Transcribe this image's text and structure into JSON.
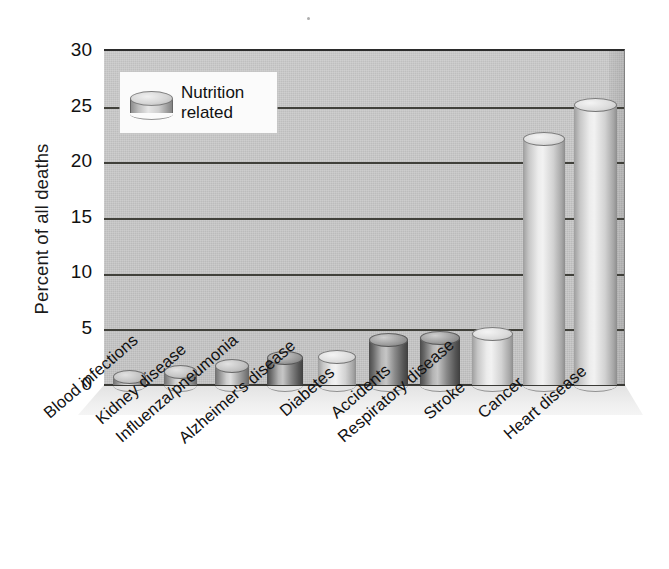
{
  "chart_data": {
    "type": "bar",
    "title": "",
    "subtitle": "",
    "xlabel": "",
    "ylabel": "Percent of all deaths",
    "ylim": [
      0,
      30
    ],
    "yticks": [
      0,
      5,
      10,
      15,
      20,
      25,
      30
    ],
    "grid": true,
    "legend_position": "top-left",
    "legend": [
      "Nutrition related"
    ],
    "categories": [
      "Blood infections",
      "Kidney disease",
      "Influenza/pneumonia",
      "Alzheimer's disease",
      "Diabetes",
      "Accidents",
      "Respiratory disease",
      "Stroke",
      "Cancer",
      "Heart disease"
    ],
    "values": [
      1.3,
      1.8,
      2.3,
      3.0,
      3.1,
      4.6,
      4.8,
      5.2,
      22.6,
      25.6
    ],
    "nutrition_related": [
      false,
      true,
      false,
      true,
      true,
      false,
      true,
      true,
      true,
      true
    ]
  },
  "axis": {
    "y_title": "Percent of all deaths",
    "y_tick_labels": [
      "30",
      "25",
      "20",
      "15",
      "10",
      "5",
      "0"
    ]
  },
  "legend": {
    "line1": "Nutrition",
    "line2": "related",
    "swatch_icon": "cylinder-icon"
  },
  "colors": {
    "plot_background": "#c8c8c8",
    "gridline": "#35352f",
    "floor": "#eeeeee",
    "text": "#111111",
    "legend_background": "#fbfbfb",
    "bar_light": "#e6e6e6",
    "bar_mid": "#a8a8a8",
    "bar_dark": "#5a5a5a"
  }
}
